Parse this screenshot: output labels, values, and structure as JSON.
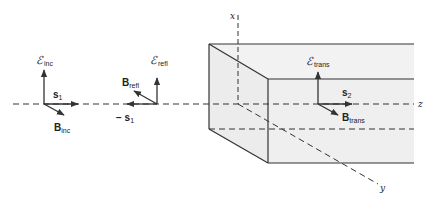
{
  "diagram": {
    "colors": {
      "line": "#333333",
      "slab_fill": "#efefef"
    },
    "axes": {
      "x": "x",
      "y": "y",
      "z": "z"
    },
    "incident": {
      "E_label": "ℰ",
      "E_sub": "inc",
      "s_label": "s",
      "s_sub": "1",
      "B_label": "B",
      "B_sub": "inc"
    },
    "reflected": {
      "E_label": "ℰ",
      "E_sub": "refl",
      "s_label": "− s",
      "s_sub": "1",
      "B_label": "B",
      "B_sub": "refl"
    },
    "transmitted": {
      "E_label": "ℰ",
      "E_sub": "trans",
      "s_label": "s",
      "s_sub": "2",
      "B_label": "B",
      "B_sub": "trans"
    }
  }
}
